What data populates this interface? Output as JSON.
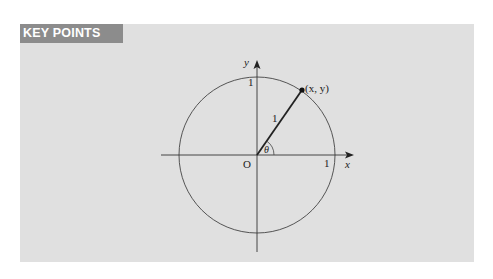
{
  "header": {
    "title": "KEY POINTS"
  },
  "diagram": {
    "labels": {
      "y_axis": "y",
      "x_axis": "x",
      "origin": "O",
      "y_intercept": "1",
      "x_intercept": "1",
      "radius": "1",
      "point": "(x, y)",
      "angle": "θ"
    }
  },
  "colors": {
    "panel_bg": "#e0e0e0",
    "header_bg": "#8c8c8c",
    "header_text": "#ffffff",
    "line": "#333333"
  }
}
